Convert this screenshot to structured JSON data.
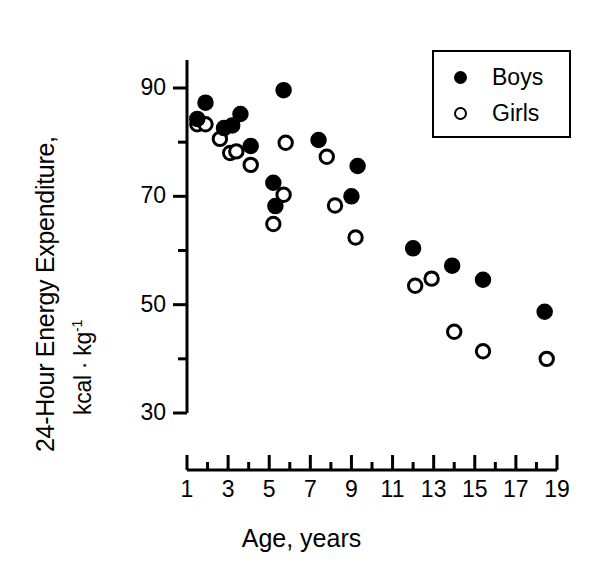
{
  "chart_data": {
    "type": "scatter",
    "title": "",
    "xlabel": "Age, years",
    "ylabel": "24-Hour Energy Expenditure, kcal · kg-1",
    "ylabel_line1": "24-Hour Energy Expenditure,",
    "ylabel_line2_base": "kcal · kg",
    "ylabel_line2_sup": "-1",
    "xlim": [
      0.4,
      19.6
    ],
    "ylim": [
      28,
      95
    ],
    "xticks": [
      1,
      3,
      5,
      7,
      9,
      11,
      13,
      15,
      17,
      19
    ],
    "xticks_minor": [
      2,
      4,
      6,
      8,
      10,
      12,
      14,
      16,
      18
    ],
    "yticks": [
      90,
      70,
      50,
      30
    ],
    "yticks_minor": [
      80,
      60,
      40
    ],
    "xtick_labels": [
      "1",
      "3",
      "5",
      "7",
      "9",
      "11",
      "13",
      "15",
      "17",
      "19"
    ],
    "ytick_labels": [
      "90",
      "70",
      "50",
      "30"
    ],
    "grid": false,
    "legend_position": "top-right",
    "series": [
      {
        "name": "Boys",
        "marker": "filled-circle",
        "color": "#000000",
        "points": [
          {
            "x": 1.5,
            "y": 84.3
          },
          {
            "x": 1.9,
            "y": 87.3
          },
          {
            "x": 2.8,
            "y": 82.6
          },
          {
            "x": 3.2,
            "y": 83.1
          },
          {
            "x": 3.6,
            "y": 85.2
          },
          {
            "x": 4.1,
            "y": 79.3
          },
          {
            "x": 5.2,
            "y": 72.5
          },
          {
            "x": 5.3,
            "y": 68.2
          },
          {
            "x": 5.7,
            "y": 89.6
          },
          {
            "x": 7.4,
            "y": 80.4
          },
          {
            "x": 9.0,
            "y": 70.0
          },
          {
            "x": 9.3,
            "y": 75.6
          },
          {
            "x": 12.0,
            "y": 60.4
          },
          {
            "x": 13.9,
            "y": 57.2
          },
          {
            "x": 15.4,
            "y": 54.6
          },
          {
            "x": 18.4,
            "y": 48.7
          }
        ]
      },
      {
        "name": "Girls",
        "marker": "open-circle",
        "color": "#000000",
        "points": [
          {
            "x": 1.5,
            "y": 83.3
          },
          {
            "x": 1.9,
            "y": 83.3
          },
          {
            "x": 2.6,
            "y": 80.6
          },
          {
            "x": 3.1,
            "y": 78.0
          },
          {
            "x": 3.4,
            "y": 78.3
          },
          {
            "x": 4.1,
            "y": 75.8
          },
          {
            "x": 5.2,
            "y": 64.9
          },
          {
            "x": 5.7,
            "y": 70.3
          },
          {
            "x": 5.8,
            "y": 79.9
          },
          {
            "x": 7.8,
            "y": 77.3
          },
          {
            "x": 8.2,
            "y": 68.3
          },
          {
            "x": 9.2,
            "y": 62.4
          },
          {
            "x": 12.1,
            "y": 53.5
          },
          {
            "x": 12.9,
            "y": 54.8
          },
          {
            "x": 14.0,
            "y": 45.0
          },
          {
            "x": 15.4,
            "y": 41.4
          },
          {
            "x": 18.5,
            "y": 40.0
          }
        ]
      }
    ]
  },
  "legend": {
    "entries": [
      {
        "label": "Boys",
        "marker": "filled-circle"
      },
      {
        "label": "Girls",
        "marker": "open-circle"
      }
    ]
  }
}
